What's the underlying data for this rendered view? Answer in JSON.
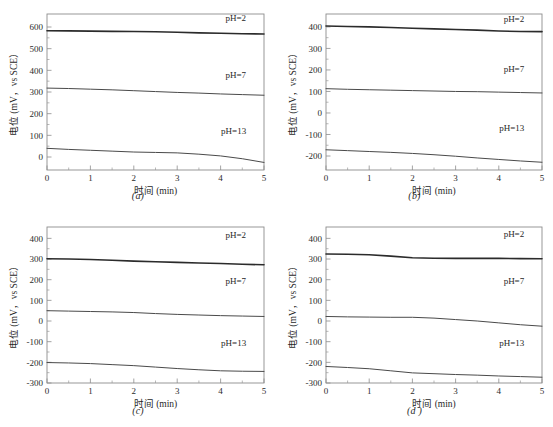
{
  "figure": {
    "panel_count": 4,
    "shared": {
      "xlabel": "时间 (min)",
      "ylabel": "电位 (mV，vs SCE）",
      "xlim": [
        0,
        5
      ],
      "xticks": [
        0,
        1,
        2,
        3,
        4,
        5
      ],
      "xtick_labels": [
        "0",
        "1",
        "2",
        "3",
        "4",
        "5"
      ],
      "minor_ticks_per_interval": 1,
      "grid": false,
      "legend_position": "inline-right-annotations",
      "series_names": [
        "pH=2",
        "pH=7",
        "pH=13"
      ],
      "curve_color": "#4a4a4a",
      "emphasis_color": "#2b2b2b",
      "frame_color": "#8d8d8d"
    }
  },
  "chart_data": [
    {
      "type": "line",
      "panel": "(a)",
      "title": "",
      "xlabel": "时间 (min)",
      "ylabel": "电位 (mV，vs SCE）",
      "xlim": [
        0,
        5
      ],
      "ylim": [
        -60,
        660
      ],
      "yticks": [
        0,
        100,
        200,
        300,
        400,
        500,
        600
      ],
      "ytick_labels": [
        "0",
        "100",
        "200",
        "300",
        "400",
        "500",
        "600"
      ],
      "x": [
        0,
        0.5,
        1,
        1.5,
        2,
        2.5,
        3,
        3.5,
        4,
        4.5,
        5
      ],
      "series": [
        {
          "name": "pH=2",
          "emphasis": true,
          "values": [
            583,
            582,
            581,
            580,
            579,
            578,
            576,
            573,
            571,
            569,
            568
          ]
        },
        {
          "name": "pH=7",
          "emphasis": false,
          "values": [
            318,
            316,
            313,
            310,
            306,
            302,
            298,
            295,
            291,
            288,
            285
          ]
        },
        {
          "name": "pH=13",
          "emphasis": false,
          "values": [
            40,
            35,
            31,
            27,
            23,
            21,
            19,
            13,
            5,
            -8,
            -25
          ]
        }
      ],
      "annotations": [
        {
          "text": "pH=2",
          "x": 4.35,
          "y": 640
        },
        {
          "text": "pH=7",
          "x": 4.35,
          "y": 378
        },
        {
          "text": "pH=13",
          "x": 4.3,
          "y": 118
        }
      ]
    },
    {
      "type": "line",
      "panel": "(b)",
      "title": "",
      "xlabel": "时间 (min)",
      "ylabel": "电位 (mV，vs SCE）",
      "xlim": [
        0,
        5
      ],
      "ylim": [
        -265,
        460
      ],
      "yticks": [
        -200,
        -100,
        0,
        100,
        200,
        300,
        400
      ],
      "ytick_labels": [
        "-200",
        "-100",
        "0",
        "100",
        "200",
        "300",
        "400"
      ],
      "x": [
        0,
        0.5,
        1,
        1.5,
        2,
        2.5,
        3,
        3.5,
        4,
        4.5,
        5
      ],
      "series": [
        {
          "name": "pH=2",
          "emphasis": true,
          "values": [
            404,
            402,
            400,
            397,
            394,
            391,
            388,
            385,
            381,
            379,
            378
          ]
        },
        {
          "name": "pH=7",
          "emphasis": false,
          "values": [
            113,
            110,
            108,
            106,
            104,
            102,
            100,
            99,
            97,
            95,
            93
          ]
        },
        {
          "name": "pH=13",
          "emphasis": false,
          "values": [
            -171,
            -175,
            -179,
            -183,
            -188,
            -194,
            -201,
            -209,
            -216,
            -223,
            -229
          ]
        }
      ],
      "annotations": [
        {
          "text": "pH=2",
          "x": 4.35,
          "y": 438
        },
        {
          "text": "pH=7",
          "x": 4.35,
          "y": 205
        },
        {
          "text": "pH=13",
          "x": 4.3,
          "y": -72
        }
      ]
    },
    {
      "type": "line",
      "panel": "(c)",
      "title": "",
      "xlabel": "时间 (min)",
      "ylabel": "电位 (mV，vs SCE）",
      "xlim": [
        0,
        5
      ],
      "ylim": [
        -300,
        455
      ],
      "yticks": [
        -300,
        -200,
        -100,
        0,
        100,
        200,
        300,
        400
      ],
      "ytick_labels": [
        "-300",
        "-200",
        "-100",
        "0",
        "100",
        "200",
        "300",
        "400"
      ],
      "x": [
        0,
        0.5,
        1,
        1.5,
        2,
        2.5,
        3,
        3.5,
        4,
        4.5,
        5
      ],
      "series": [
        {
          "name": "pH=2",
          "emphasis": true,
          "values": [
            301,
            300,
            298,
            294,
            290,
            287,
            284,
            281,
            278,
            275,
            272
          ]
        },
        {
          "name": "pH=7",
          "emphasis": false,
          "values": [
            50,
            48,
            46,
            44,
            41,
            36,
            32,
            29,
            26,
            24,
            22
          ]
        },
        {
          "name": "pH=13",
          "emphasis": false,
          "values": [
            -201,
            -203,
            -206,
            -211,
            -216,
            -223,
            -230,
            -236,
            -241,
            -243,
            -244
          ]
        }
      ],
      "annotations": [
        {
          "text": "pH=2",
          "x": 4.35,
          "y": 418
        },
        {
          "text": "pH=7",
          "x": 4.35,
          "y": 195
        },
        {
          "text": "pH=13",
          "x": 4.3,
          "y": -105
        }
      ]
    },
    {
      "type": "line",
      "panel": "(d )",
      "title": "",
      "xlabel": "时间 (min)",
      "ylabel": "电位 (mV，vs SCE）",
      "xlim": [
        0,
        5
      ],
      "ylim": [
        -300,
        455
      ],
      "yticks": [
        -300,
        -200,
        -100,
        0,
        100,
        200,
        300,
        400
      ],
      "ytick_labels": [
        "-300",
        "-200",
        "-100",
        "0",
        "100",
        "200",
        "300",
        "400"
      ],
      "x": [
        0,
        0.5,
        1,
        1.5,
        2,
        2.5,
        3,
        3.5,
        4,
        4.5,
        5
      ],
      "series": [
        {
          "name": "pH=2",
          "emphasis": true,
          "values": [
            324,
            323,
            321,
            314,
            306,
            304,
            303,
            303,
            303,
            302,
            301
          ]
        },
        {
          "name": "pH=7",
          "emphasis": false,
          "values": [
            22,
            20,
            19,
            18,
            18,
            14,
            7,
            0,
            -9,
            -18,
            -25
          ]
        },
        {
          "name": "pH=13",
          "emphasis": false,
          "values": [
            -220,
            -225,
            -231,
            -241,
            -251,
            -255,
            -259,
            -262,
            -266,
            -269,
            -272
          ]
        }
      ],
      "annotations": [
        {
          "text": "pH=2",
          "x": 4.35,
          "y": 420
        },
        {
          "text": "pH=7",
          "x": 4.35,
          "y": 196
        },
        {
          "text": "pH=13",
          "x": 4.3,
          "y": -105
        }
      ]
    }
  ]
}
